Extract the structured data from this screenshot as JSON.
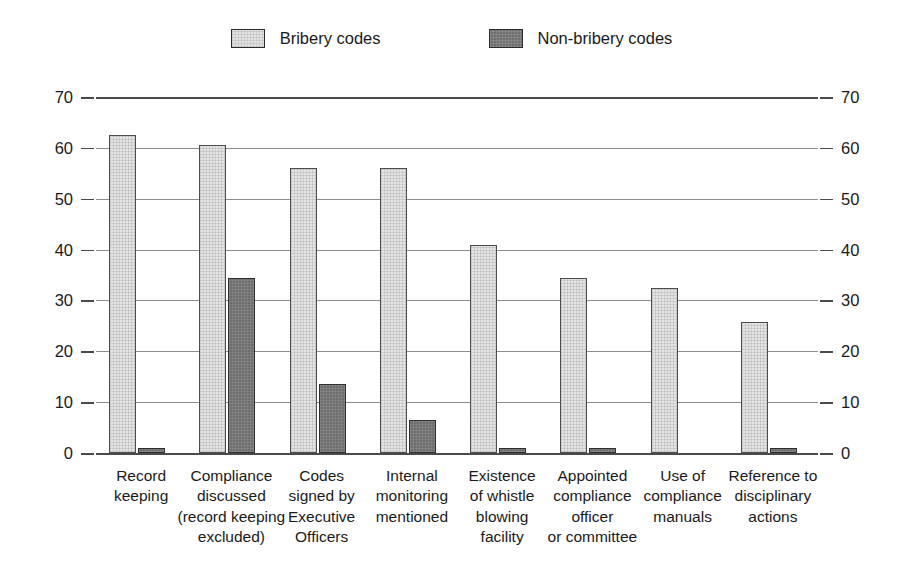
{
  "legend": {
    "items": [
      {
        "label": "Bribery codes",
        "swatch": "light-gray-hatched",
        "color": "#e2e2e2"
      },
      {
        "label": "Non-bribery codes",
        "swatch": "dark-gray-hatched",
        "color": "#6f6f6f"
      }
    ]
  },
  "axis": {
    "left_ticks": [
      "70",
      "60",
      "50",
      "40",
      "30",
      "20",
      "10",
      "0"
    ],
    "right_ticks": [
      "70",
      "60",
      "50",
      "40",
      "30",
      "20",
      "10",
      "0"
    ]
  },
  "categories_display": [
    "Record\nkeeping",
    "Compliance\ndiscussed\n(record keeping\nexcluded)",
    "Codes\nsigned by\nExecutive\nOfficers",
    "Internal\nmonitoring\nmentioned",
    "Existence\nof whistle\nblowing\nfacility",
    "Appointed\ncompliance\nofficer\nor committee",
    "Use of\ncompliance\nmanuals",
    "Reference to\ndisciplinary\nactions"
  ],
  "chart_data": {
    "type": "bar",
    "title": "",
    "subtitle": "",
    "xlabel": "",
    "ylabel": "",
    "ylim": [
      0,
      70
    ],
    "yticks": [
      0,
      10,
      20,
      30,
      40,
      50,
      60,
      70
    ],
    "grid": true,
    "dual_axis": true,
    "legend_position": "top-center",
    "categories": [
      "Record keeping",
      "Compliance discussed (record keeping excluded)",
      "Codes signed by Executive Officers",
      "Internal monitoring mentioned",
      "Existence of whistle blowing facility",
      "Appointed compliance officer or committee",
      "Use of compliance manuals",
      "Reference to disciplinary actions"
    ],
    "series": [
      {
        "name": "Bribery codes",
        "color": "#e2e2e2",
        "values": [
          62.5,
          60.5,
          56,
          56,
          41,
          34.5,
          32.5,
          25.8
        ]
      },
      {
        "name": "Non-bribery codes",
        "color": "#6f6f6f",
        "values": [
          1,
          34.5,
          13.5,
          6.5,
          1,
          1,
          0,
          1
        ]
      }
    ]
  }
}
